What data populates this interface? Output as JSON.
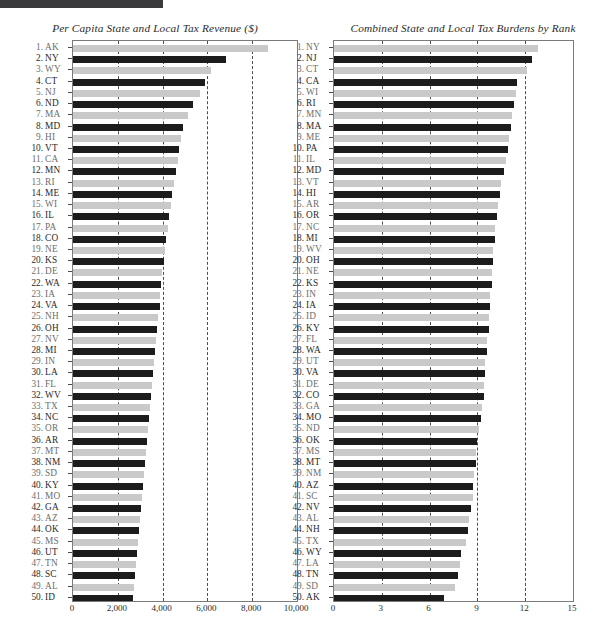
{
  "header": {
    "bar_label": "title-bar"
  },
  "charts": [
    {
      "id": "per-capita-tax-revenue",
      "title": "Per Capita State and Local Tax Revenue ($)",
      "xmin": 0,
      "xmax": 10000,
      "xticks": [
        0,
        2000,
        4000,
        6000,
        8000,
        10000
      ],
      "xtick_labels": [
        "0",
        "2,000",
        "4,000",
        "6,000",
        "8,000",
        "10,000"
      ],
      "gridlines": [
        2000,
        4000,
        6000,
        8000
      ],
      "categories": [
        "AK",
        "NY",
        "WY",
        "CT",
        "NJ",
        "ND",
        "MA",
        "MD",
        "HI",
        "VT",
        "CA",
        "MN",
        "RI",
        "ME",
        "WI",
        "IL",
        "PA",
        "CO",
        "NE",
        "KS",
        "DE",
        "WA",
        "IA",
        "VA",
        "NH",
        "OH",
        "NV",
        "MI",
        "IN",
        "LA",
        "FL",
        "WV",
        "TX",
        "NC",
        "OR",
        "AR",
        "MT",
        "NM",
        "SD",
        "KY",
        "MO",
        "GA",
        "AZ",
        "OK",
        "MS",
        "UT",
        "TN",
        "SC",
        "AL",
        "ID"
      ],
      "values": [
        8700,
        6850,
        6150,
        5900,
        5650,
        5350,
        5150,
        4900,
        4800,
        4750,
        4700,
        4620,
        4530,
        4420,
        4380,
        4300,
        4230,
        4150,
        4100,
        4060,
        3980,
        3940,
        3900,
        3870,
        3800,
        3760,
        3720,
        3650,
        3620,
        3580,
        3530,
        3490,
        3440,
        3400,
        3360,
        3300,
        3260,
        3220,
        3170,
        3120,
        3080,
        3020,
        2990,
        2950,
        2900,
        2860,
        2820,
        2790,
        2740,
        2700
      ]
    },
    {
      "id": "combined-tax-burdens-by-rank",
      "title": "Combined State and Local Tax Burdens by Rank",
      "xmin": 0,
      "xmax": 15,
      "xticks": [
        0,
        3,
        6,
        9,
        12,
        15
      ],
      "xtick_labels": [
        "0",
        "3",
        "6",
        "9",
        "12",
        "15"
      ],
      "gridlines": [
        3,
        6,
        9,
        12
      ],
      "categories": [
        "NY",
        "NJ",
        "CT",
        "CA",
        "WI",
        "RI",
        "MN",
        "MA",
        "ME",
        "PA",
        "IL",
        "MD",
        "VT",
        "HI",
        "AR",
        "OR",
        "NC",
        "MI",
        "WV",
        "OH",
        "NE",
        "KS",
        "IN",
        "IA",
        "ID",
        "KY",
        "FL",
        "WA",
        "UT",
        "VA",
        "DE",
        "CO",
        "GA",
        "MO",
        "ND",
        "OK",
        "MS",
        "MT",
        "NM",
        "AZ",
        "SC",
        "NV",
        "AL",
        "NH",
        "TX",
        "WY",
        "LA",
        "TN",
        "SD",
        "AK"
      ],
      "values": [
        12.8,
        12.4,
        12.1,
        11.5,
        11.4,
        11.3,
        11.2,
        11.1,
        11.0,
        10.9,
        10.8,
        10.7,
        10.5,
        10.4,
        10.3,
        10.2,
        10.1,
        10.1,
        10.0,
        10.0,
        9.9,
        9.9,
        9.8,
        9.8,
        9.7,
        9.7,
        9.6,
        9.6,
        9.5,
        9.5,
        9.4,
        9.4,
        9.3,
        9.2,
        9.1,
        9.0,
        8.9,
        8.9,
        8.8,
        8.7,
        8.7,
        8.6,
        8.5,
        8.4,
        8.3,
        8.0,
        7.9,
        7.8,
        7.6,
        6.9
      ]
    }
  ],
  "chart_data": [
    {
      "type": "bar",
      "orientation": "horizontal",
      "title": "Per Capita State and Local Tax Revenue ($)",
      "xlabel": "",
      "ylabel": "",
      "xlim": [
        0,
        10000
      ],
      "grid": true,
      "legend": "none",
      "categories": [
        "AK",
        "NY",
        "WY",
        "CT",
        "NJ",
        "ND",
        "MA",
        "MD",
        "HI",
        "VT",
        "CA",
        "MN",
        "RI",
        "ME",
        "WI",
        "IL",
        "PA",
        "CO",
        "NE",
        "KS",
        "DE",
        "WA",
        "IA",
        "VA",
        "NH",
        "OH",
        "NV",
        "MI",
        "IN",
        "LA",
        "FL",
        "WV",
        "TX",
        "NC",
        "OR",
        "AR",
        "MT",
        "NM",
        "SD",
        "KY",
        "MO",
        "GA",
        "AZ",
        "OK",
        "MS",
        "UT",
        "TN",
        "SC",
        "AL",
        "ID"
      ],
      "ranks": [
        1,
        2,
        3,
        4,
        5,
        6,
        7,
        8,
        9,
        10,
        11,
        12,
        13,
        14,
        15,
        16,
        17,
        18,
        19,
        20,
        21,
        22,
        23,
        24,
        25,
        26,
        27,
        28,
        29,
        30,
        31,
        32,
        33,
        34,
        35,
        36,
        37,
        38,
        39,
        40,
        41,
        42,
        43,
        44,
        45,
        46,
        47,
        48,
        49,
        50
      ],
      "values": [
        8700,
        6850,
        6150,
        5900,
        5650,
        5350,
        5150,
        4900,
        4800,
        4750,
        4700,
        4620,
        4530,
        4420,
        4380,
        4300,
        4230,
        4150,
        4100,
        4060,
        3980,
        3940,
        3900,
        3870,
        3800,
        3760,
        3720,
        3650,
        3620,
        3580,
        3530,
        3490,
        3440,
        3400,
        3360,
        3300,
        3260,
        3220,
        3170,
        3120,
        3080,
        3020,
        2990,
        2950,
        2900,
        2860,
        2820,
        2790,
        2740,
        2700
      ],
      "tick_labels": [
        "0",
        "2,000",
        "4,000",
        "6,000",
        "8,000",
        "10,000"
      ]
    },
    {
      "type": "bar",
      "orientation": "horizontal",
      "title": "Combined State and Local Tax Burdens by Rank",
      "xlabel": "",
      "ylabel": "",
      "xlim": [
        0,
        15
      ],
      "grid": true,
      "legend": "none",
      "categories": [
        "NY",
        "NJ",
        "CT",
        "CA",
        "WI",
        "RI",
        "MN",
        "MA",
        "ME",
        "PA",
        "IL",
        "MD",
        "VT",
        "HI",
        "AR",
        "OR",
        "NC",
        "MI",
        "WV",
        "OH",
        "NE",
        "KS",
        "IN",
        "IA",
        "ID",
        "KY",
        "FL",
        "WA",
        "UT",
        "VA",
        "DE",
        "CO",
        "GA",
        "MO",
        "ND",
        "OK",
        "MS",
        "MT",
        "NM",
        "AZ",
        "SC",
        "NV",
        "AL",
        "NH",
        "TX",
        "WY",
        "LA",
        "TN",
        "SD",
        "AK"
      ],
      "ranks": [
        1,
        2,
        3,
        4,
        5,
        6,
        7,
        8,
        9,
        10,
        11,
        12,
        13,
        14,
        15,
        16,
        17,
        18,
        19,
        20,
        21,
        22,
        23,
        24,
        25,
        26,
        27,
        28,
        29,
        30,
        31,
        32,
        33,
        34,
        35,
        36,
        37,
        38,
        39,
        40,
        41,
        42,
        43,
        44,
        45,
        46,
        47,
        48,
        49,
        50
      ],
      "values": [
        12.8,
        12.4,
        12.1,
        11.5,
        11.4,
        11.3,
        11.2,
        11.1,
        11.0,
        10.9,
        10.8,
        10.7,
        10.5,
        10.4,
        10.3,
        10.2,
        10.1,
        10.1,
        10.0,
        10.0,
        9.9,
        9.9,
        9.8,
        9.8,
        9.7,
        9.7,
        9.6,
        9.6,
        9.5,
        9.5,
        9.4,
        9.4,
        9.3,
        9.2,
        9.1,
        9.0,
        8.9,
        8.9,
        8.8,
        8.7,
        8.7,
        8.6,
        8.5,
        8.4,
        8.3,
        8.0,
        7.9,
        7.8,
        7.6,
        6.9
      ],
      "tick_labels": [
        "0",
        "3",
        "6",
        "9",
        "12",
        "15"
      ]
    }
  ],
  "colors": {
    "bar_dark": "#1c1c1c",
    "bar_light": "#c9c9c9",
    "grid": "#4d4d4d",
    "frame": "#7a7a7a",
    "topbar": "#3a3a3c"
  }
}
